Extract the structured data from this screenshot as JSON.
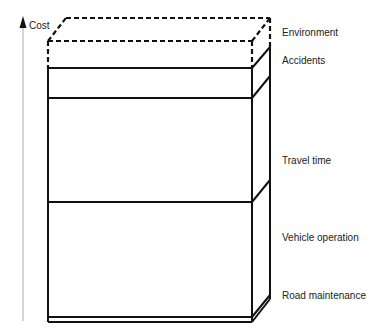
{
  "axis": {
    "label": "Cost"
  },
  "components": [
    {
      "label": "Environment",
      "style": "dashed"
    },
    {
      "label": "Accidents",
      "style": "solid"
    },
    {
      "label": "Travel time",
      "style": "solid"
    },
    {
      "label": "Vehicle operation",
      "style": "solid"
    },
    {
      "label": "Road maintenance",
      "style": "solid"
    }
  ],
  "colors": {
    "line": "#111111",
    "axis": "#999999",
    "text": "#222222"
  }
}
